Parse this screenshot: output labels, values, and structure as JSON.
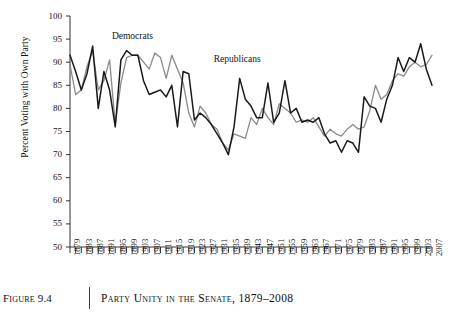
{
  "caption": {
    "figure_number": "Figure 9.4",
    "title": "Party Unity in the Senate, 1879–2008"
  },
  "chart_data": {
    "type": "line",
    "title": "",
    "xlabel": "",
    "ylabel": "Percent Voting with Own Party",
    "ylim": [
      50,
      100
    ],
    "ytick_labels": [
      "100",
      "95",
      "90",
      "85",
      "80",
      "75",
      "70",
      "65",
      "60",
      "55",
      "50"
    ],
    "ytick_values": [
      100,
      95,
      90,
      85,
      80,
      75,
      70,
      65,
      60,
      55,
      50
    ],
    "xlim": [
      1879,
      2007
    ],
    "x_tick_step": 2,
    "x_label_step": 4,
    "xtick_labels": [
      "1879",
      "1883",
      "1887",
      "1891",
      "1895",
      "1899",
      "1903",
      "1907",
      "1911",
      "1915",
      "1919",
      "1923",
      "1927",
      "1931",
      "1935",
      "1939",
      "1943",
      "1947",
      "1951",
      "1955",
      "1959",
      "1963",
      "1967",
      "1971",
      "1975",
      "1979",
      "1983",
      "1987",
      "1991",
      "1995",
      "1999",
      "2003",
      "2007"
    ],
    "grid": false,
    "legend_position": "inline-annotations",
    "annotations": [
      {
        "text": "Democrats",
        "x": 1903,
        "y": 95.5
      },
      {
        "text": "Republicans",
        "x": 1939,
        "y": 90.5
      }
    ],
    "x": [
      1879,
      1881,
      1883,
      1885,
      1887,
      1889,
      1891,
      1893,
      1895,
      1897,
      1899,
      1901,
      1903,
      1905,
      1907,
      1909,
      1911,
      1913,
      1915,
      1917,
      1919,
      1921,
      1923,
      1925,
      1927,
      1929,
      1931,
      1933,
      1935,
      1937,
      1939,
      1941,
      1943,
      1945,
      1947,
      1949,
      1951,
      1953,
      1955,
      1957,
      1959,
      1961,
      1963,
      1965,
      1967,
      1969,
      1971,
      1973,
      1975,
      1977,
      1979,
      1981,
      1983,
      1985,
      1987,
      1989,
      1991,
      1993,
      1995,
      1997,
      1999,
      2001,
      2003,
      2005,
      2007
    ],
    "series": [
      {
        "name": "Democrats",
        "color": "#8a8a8a",
        "values": [
          89.5,
          83.0,
          84.0,
          89.0,
          92.5,
          84.0,
          86.0,
          90.5,
          76.5,
          85.5,
          91.0,
          91.5,
          91.5,
          90.0,
          88.5,
          92.0,
          91.0,
          86.5,
          91.5,
          88.5,
          85.5,
          79.0,
          76.0,
          80.5,
          79.0,
          76.5,
          75.5,
          72.5,
          71.0,
          74.5,
          74.0,
          73.5,
          78.0,
          76.5,
          80.0,
          78.0,
          76.5,
          81.0,
          80.0,
          79.0,
          77.0,
          77.5,
          77.0,
          78.0,
          76.0,
          74.0,
          75.5,
          74.5,
          74.0,
          75.5,
          76.5,
          75.5,
          76.0,
          79.5,
          85.0,
          82.0,
          83.0,
          86.0,
          87.5,
          87.0,
          89.0,
          90.0,
          89.0,
          89.5,
          91.5
        ]
      },
      {
        "name": "Republicans",
        "color": "#1a1a1a",
        "values": [
          91.5,
          88.0,
          84.0,
          87.5,
          93.5,
          80.0,
          88.0,
          84.0,
          76.0,
          90.5,
          92.5,
          91.5,
          91.5,
          86.0,
          83.0,
          83.5,
          84.0,
          82.5,
          85.0,
          76.0,
          88.0,
          87.5,
          77.5,
          79.0,
          78.0,
          76.5,
          74.5,
          72.5,
          70.0,
          76.0,
          86.5,
          82.0,
          80.5,
          78.0,
          78.0,
          85.5,
          77.0,
          79.0,
          86.0,
          79.0,
          80.0,
          77.0,
          77.5,
          77.0,
          78.0,
          74.5,
          72.5,
          73.0,
          70.5,
          73.0,
          72.5,
          70.5,
          82.5,
          80.5,
          80.0,
          77.0,
          82.0,
          85.0,
          91.0,
          88.0,
          91.0,
          90.0,
          94.0,
          88.5,
          85.0
        ]
      }
    ]
  }
}
